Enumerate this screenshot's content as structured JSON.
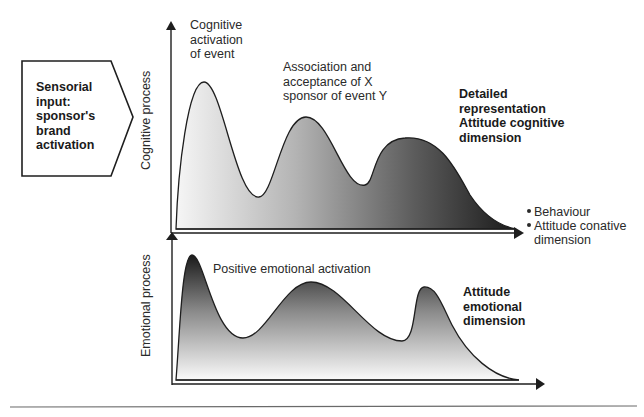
{
  "input_box": {
    "lines": [
      "Sensorial",
      "input:",
      "sponsor's",
      "brand",
      "activation"
    ]
  },
  "axes": {
    "cognitive": {
      "label": "Cognitive process"
    },
    "emotional": {
      "label": "Emotional process"
    }
  },
  "cognitive_annotations": {
    "peak1": [
      "Cognitive",
      "activation",
      "of event"
    ],
    "peak2": [
      "Association and",
      "acceptance of X",
      "sponsor of event Y"
    ],
    "peak3": [
      "Detailed",
      "representation",
      "Attitude cognitive",
      "dimension"
    ]
  },
  "emotional_annotations": {
    "peak1": "Positive emotional activation",
    "peak3": [
      "Attitude",
      "emotional",
      "dimension"
    ]
  },
  "outcome": {
    "items": [
      {
        "text": "Behaviour"
      },
      {
        "text": "Attitude conative",
        "continuation": "dimension"
      }
    ]
  },
  "colors": {
    "stroke": "#1e1e1e",
    "fill_light": "#f4f4f4",
    "fill_dark": "#1c1c1c"
  }
}
